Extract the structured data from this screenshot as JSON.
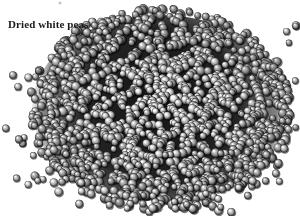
{
  "figure": {
    "width": 300,
    "height": 216,
    "background_color": "#ffffff",
    "caption": "Dried white peas",
    "caption_color": "#1a1a1a",
    "alt_text": "Dried white peas"
  },
  "pile": {
    "center_x": 160,
    "center_y": 108,
    "radius_x": 132,
    "radius_y": 98,
    "bounds": {
      "left": 28,
      "top": 10,
      "right": 292,
      "bottom": 205
    },
    "pea_count": 1500,
    "pea_diameter_min": 6,
    "pea_diameter_max": 9.5,
    "highlight_color": "#f2f2f2",
    "body_color": "#8a8a8a",
    "shadow_color": "#1c1c1c",
    "gap_color": "#101010",
    "scatter_count": 70
  },
  "artifact": {
    "name": "top-speck",
    "x": 58,
    "y": 1,
    "color": "#5a5a5a"
  }
}
